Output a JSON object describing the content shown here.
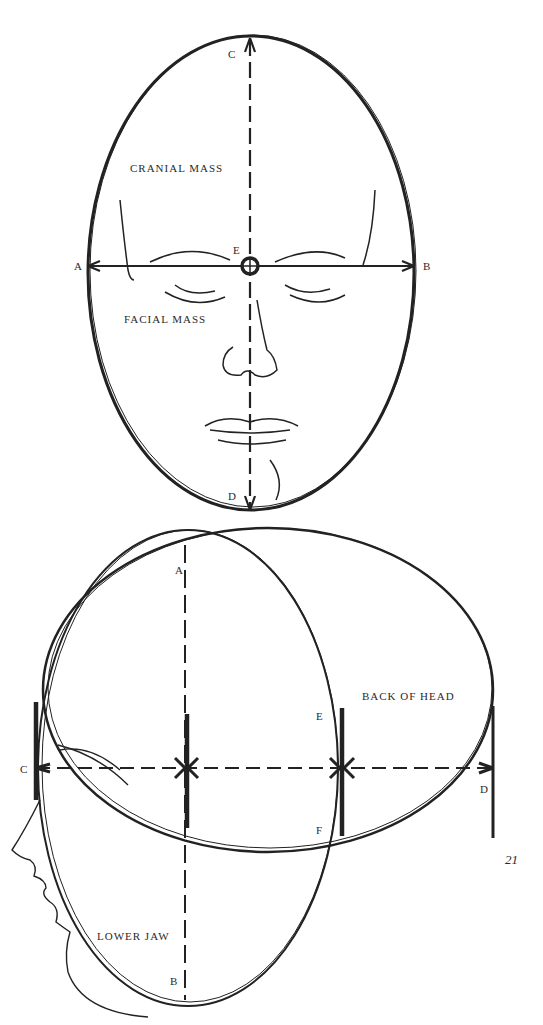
{
  "front_view": {
    "labels": {
      "cranial": "CRANIAL MASS",
      "facial": "FACIAL MASS",
      "A": "A",
      "B": "B",
      "C": "C",
      "D": "D",
      "E": "E"
    }
  },
  "side_view": {
    "labels": {
      "back": "BACK OF HEAD",
      "jaw": "LOWER JAW",
      "A": "A",
      "B": "B",
      "C": "C",
      "D": "D",
      "E": "E",
      "F": "F"
    }
  },
  "page_number": "21",
  "colors": {
    "ink": "#222222",
    "paper": "#ffffff"
  }
}
